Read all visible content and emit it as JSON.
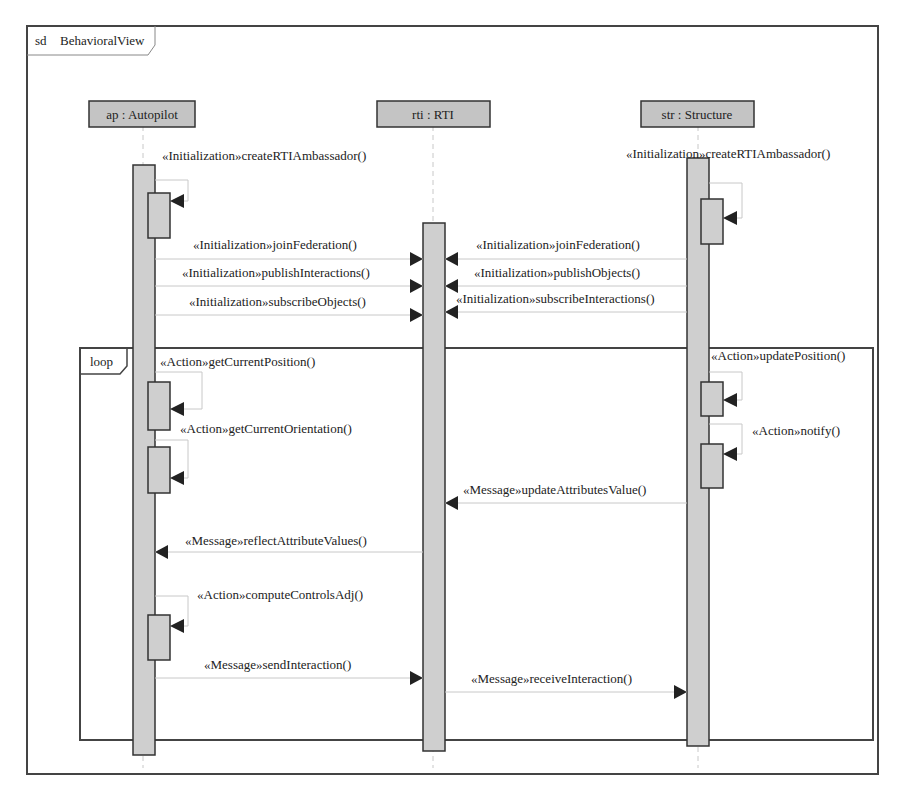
{
  "frame": {
    "keyword": "sd",
    "name": "BehavioralView"
  },
  "colors": {
    "lifeline_head_fill": "#c4c4c4",
    "activation_fill": "#cfcfcf",
    "border": "#333333",
    "message_line": "#c8c8c8",
    "arrow": "#222222"
  },
  "lifelines": [
    {
      "id": "ap",
      "label": "ap : Autopilot",
      "x": 143
    },
    {
      "id": "rti",
      "label": "rti : RTI",
      "x": 433
    },
    {
      "id": "str",
      "label": "str : Structure",
      "x": 698
    }
  ],
  "combined_fragment": {
    "operator": "loop"
  },
  "messages": [
    {
      "from": "ap",
      "to": "ap",
      "stereotype": "«Initialization»",
      "name": "createRTIAmbassador()",
      "label": "«Initialization»createRTIAmbassador()"
    },
    {
      "from": "str",
      "to": "str",
      "stereotype": "«Initialization»",
      "name": "createRTIAmbassador()",
      "label": "«Initialization»createRTIAmbassador()"
    },
    {
      "from": "ap",
      "to": "rti",
      "stereotype": "«Initialization»",
      "name": "joinFederation()",
      "label": "«Initialization»joinFederation()"
    },
    {
      "from": "str",
      "to": "rti",
      "stereotype": "«Initialization»",
      "name": "joinFederation()",
      "label": "«Initialization»joinFederation()"
    },
    {
      "from": "ap",
      "to": "rti",
      "stereotype": "«Initialization»",
      "name": "publishInteractions()",
      "label": "«Initialization»publishInteractions()"
    },
    {
      "from": "str",
      "to": "rti",
      "stereotype": "«Initialization»",
      "name": "publishObjects()",
      "label": "«Initialization»publishObjects()"
    },
    {
      "from": "ap",
      "to": "rti",
      "stereotype": "«Initialization»",
      "name": "subscribeObjects()",
      "label": "«Initialization»subscribeObjects()"
    },
    {
      "from": "str",
      "to": "rti",
      "stereotype": "«Initialization»",
      "name": "subscribeInteractions()",
      "label": "«Initialization»subscribeInteractions()"
    },
    {
      "from": "ap",
      "to": "ap",
      "stereotype": "«Action»",
      "name": "getCurrentPosition()",
      "label": "«Action»getCurrentPosition()"
    },
    {
      "from": "str",
      "to": "str",
      "stereotype": "«Action»",
      "name": "updatePosition()",
      "label": "«Action»updatePosition()"
    },
    {
      "from": "ap",
      "to": "ap",
      "stereotype": "«Action»",
      "name": "getCurrentOrientation()",
      "label": "«Action»getCurrentOrientation()"
    },
    {
      "from": "str",
      "to": "str",
      "stereotype": "«Action»",
      "name": "notify()",
      "label": "«Action»notify()"
    },
    {
      "from": "str",
      "to": "rti",
      "stereotype": "«Message»",
      "name": "updateAttributesValue()",
      "label": "«Message»updateAttributesValue()"
    },
    {
      "from": "rti",
      "to": "ap",
      "stereotype": "«Message»",
      "name": "reflectAttributeValues()",
      "label": "«Message»reflectAttributeValues()"
    },
    {
      "from": "ap",
      "to": "ap",
      "stereotype": "«Action»",
      "name": "computeControlsAdj()",
      "label": "«Action»computeControlsAdj()"
    },
    {
      "from": "ap",
      "to": "rti",
      "stereotype": "«Message»",
      "name": "sendInteraction()",
      "label": "«Message»sendInteraction()"
    },
    {
      "from": "rti",
      "to": "str",
      "stereotype": "«Message»",
      "name": "receiveInteraction()",
      "label": "«Message»receiveInteraction()"
    }
  ]
}
